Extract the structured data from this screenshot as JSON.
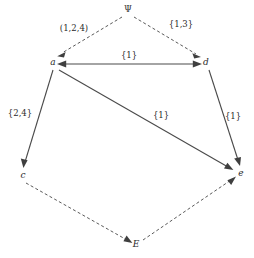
{
  "diagram": {
    "type": "directed-graph",
    "title": "",
    "nodes": [
      {
        "id": "psi",
        "label": "Ψ",
        "x": 128,
        "y": 12,
        "style": "greek"
      },
      {
        "id": "a",
        "label": "a",
        "x": 53,
        "y": 62,
        "style": "italic"
      },
      {
        "id": "d",
        "label": "d",
        "x": 205,
        "y": 62,
        "style": "italic"
      },
      {
        "id": "c",
        "label": "c",
        "x": 23,
        "y": 175,
        "style": "italic"
      },
      {
        "id": "e",
        "label": "e",
        "x": 240,
        "y": 173,
        "style": "italic"
      },
      {
        "id": "E",
        "label": "E",
        "x": 136,
        "y": 244,
        "style": "italic"
      }
    ],
    "edges": [
      {
        "id": "psi-a",
        "from": "psi",
        "to": "a",
        "line": "dashed",
        "arrow": "end",
        "label": "(1,2,4)",
        "label_x": 74,
        "label_y": 31
      },
      {
        "id": "psi-d",
        "from": "psi",
        "to": "d",
        "line": "dashed",
        "arrow": "end",
        "label": "{1,3}",
        "label_x": 180,
        "label_y": 27
      },
      {
        "id": "a-d",
        "from": "a",
        "to": "d",
        "line": "solid",
        "arrow": "both",
        "label": "{1}",
        "label_x": 129,
        "label_y": 58
      },
      {
        "id": "a-c",
        "from": "a",
        "to": "c",
        "line": "solid",
        "arrow": "end",
        "label": "{2,4}",
        "label_x": 20,
        "label_y": 113
      },
      {
        "id": "a-e",
        "from": "a",
        "to": "e",
        "line": "solid",
        "arrow": "end",
        "label": "{1}",
        "label_x": 160,
        "label_y": 117
      },
      {
        "id": "d-e",
        "from": "d",
        "to": "e",
        "line": "solid",
        "arrow": "end",
        "label": "{1}",
        "label_x": 232,
        "label_y": 118
      },
      {
        "id": "c-E",
        "from": "c",
        "to": "E",
        "line": "dashed",
        "arrow": "end",
        "label": "",
        "label_x": 0,
        "label_y": 0
      },
      {
        "id": "E-e",
        "from": "E",
        "to": "e",
        "line": "dashed",
        "arrow": "end",
        "label": "",
        "label_x": 0,
        "label_y": 0
      }
    ],
    "colors": {
      "background": "#ffffff",
      "edge_solid": "#4a4a4a",
      "edge_dashed": "#5a5a5a",
      "label_text": "#2b2b2b",
      "arrow_fill": "#3f3f3f"
    }
  }
}
